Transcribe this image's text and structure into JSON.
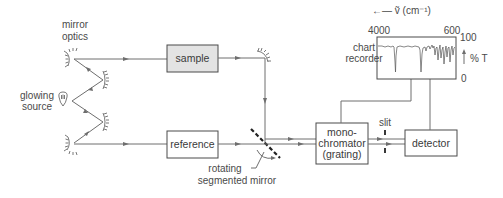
{
  "labels": {
    "mirror_optics": [
      "mirror",
      "optics"
    ],
    "glowing_source": [
      "glowing",
      "source"
    ],
    "rotating_mirror": [
      "rotating",
      "segmented mirror"
    ],
    "slit": "slit",
    "chart_recorder": [
      "chart",
      "recorder"
    ]
  },
  "boxes": {
    "sample": "sample",
    "reference": "reference",
    "monochromator": [
      "mono-",
      "chromator",
      "(grating)"
    ],
    "detector": "detector"
  },
  "chart_recorder_axes": {
    "x_axis_label": "←— ṽ (cm⁻¹)",
    "x_left": "4000",
    "x_right": "600",
    "y_top": "100",
    "y_bottom": "0",
    "y_label": "% T"
  },
  "colors": {
    "line": "#6e6e6e",
    "box_border": "#4a4a4a",
    "sample_fill": "#e3e3e3",
    "text": "#4a4a4a"
  }
}
